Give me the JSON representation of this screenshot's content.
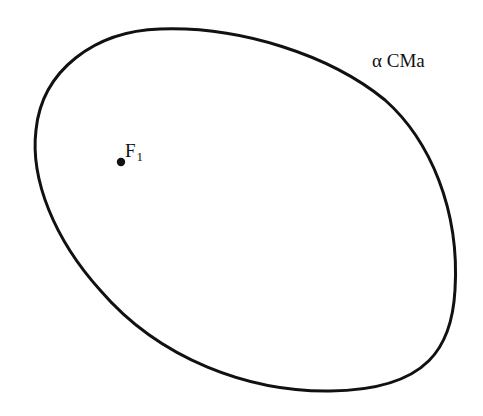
{
  "diagram": {
    "type": "orbit-ellipse",
    "star_label": "α CMa",
    "focus": {
      "letter": "F",
      "subscript": "1",
      "x": 121,
      "y": 162
    },
    "ellipse": {
      "stroke_color": "#111111",
      "stroke_width": 3
    },
    "colors": {
      "background": "#ffffff",
      "ink": "#111111"
    }
  }
}
